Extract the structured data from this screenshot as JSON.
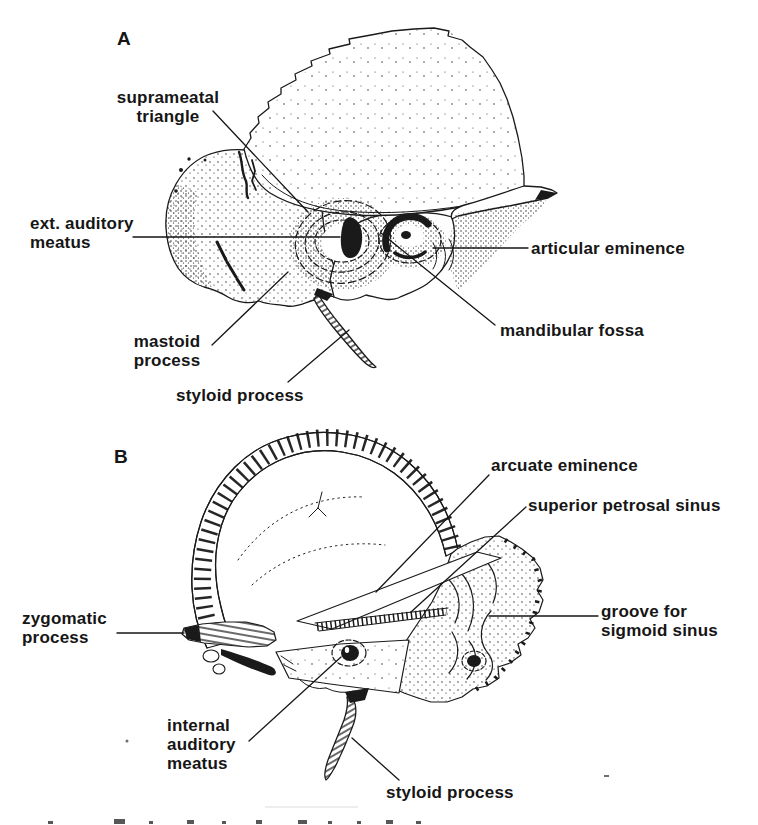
{
  "figure": {
    "ink_color": "#1a1a1a",
    "paper_color": "#ffffff",
    "panel_a": {
      "letter": "A",
      "labels": {
        "suprameatal_triangle": "suprameatal\ntriangle",
        "ext_auditory_meatus": "ext. auditory\nmeatus",
        "articular_eminence": "articular eminence",
        "mandibular_fossa": "mandibular fossa",
        "mastoid_process": "mastoid\nprocess",
        "styloid_process": "styloid process"
      }
    },
    "panel_b": {
      "letter": "B",
      "labels": {
        "arcuate_eminence": "arcuate eminence",
        "superior_petrosal_sinus": "superior petrosal sinus",
        "groove_for_sigmoid_sinus": "groove for\nsigmoid sinus",
        "zygomatic_process": "zygomatic\nprocess",
        "internal_auditory_meatus": "internal\nauditory\nmeatus",
        "styloid_process": "styloid process"
      }
    }
  }
}
